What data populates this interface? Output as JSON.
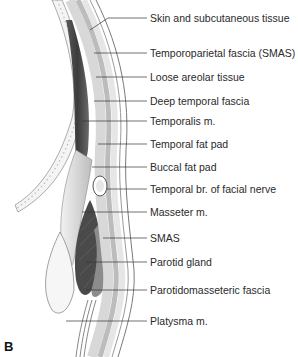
{
  "figure": {
    "panel_letter": "B",
    "labels": [
      {
        "text": "Skin and subcutaneous tissue",
        "y": 16
      },
      {
        "text": "Temporoparietal fascia (SMAS)",
        "y": 52
      },
      {
        "text": "Loose areolar tissue",
        "y": 76
      },
      {
        "text": "Deep temporal fascia",
        "y": 100
      },
      {
        "text": "Temporalis m.",
        "y": 120
      },
      {
        "text": "Temporal fat pad",
        "y": 143
      },
      {
        "text": "Buccal fat pad",
        "y": 166
      },
      {
        "text": "Temporal br. of facial nerve",
        "y": 189
      },
      {
        "text": "Masseter m.",
        "y": 211
      },
      {
        "text": "SMAS",
        "y": 237
      },
      {
        "text": "Parotid gland",
        "y": 261
      },
      {
        "text": "Parotidomasseteric fascia",
        "y": 289
      },
      {
        "text": "Platysma m.",
        "y": 320
      }
    ]
  }
}
